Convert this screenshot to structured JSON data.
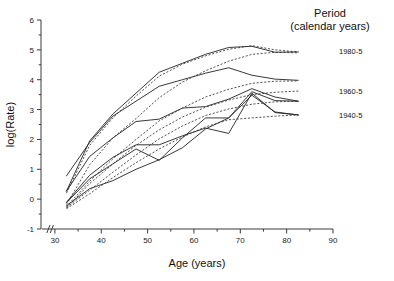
{
  "chart_data": {
    "type": "line",
    "title": "",
    "xlabel": "Age (years)",
    "ylabel": "log(Rate)",
    "xlim": [
      27,
      90
    ],
    "ylim": [
      -1,
      6
    ],
    "xticks": [
      30,
      40,
      50,
      60,
      70,
      80,
      90
    ],
    "xtick_labels": [
      "30",
      "40",
      "50",
      "60",
      "70",
      "80",
      "90"
    ],
    "xminor_step": 5,
    "yticks": [
      -1,
      0,
      1,
      2,
      3,
      4,
      5,
      6
    ],
    "ytick_labels": [
      "-1",
      "0",
      "1",
      "2",
      "3",
      "4",
      "5",
      "6"
    ],
    "grid": false,
    "axis_break": "//",
    "axis_break_note": "x axis broken between 0 and 27",
    "legend": {
      "position": "right-outside",
      "title_line1": "Period",
      "title_line2": "(calendar years)",
      "entries": [
        {
          "label": "1980-5",
          "y_at_label": 4.95
        },
        {
          "label": "1960-5",
          "y_at_label": 3.62
        },
        {
          "label": "1940-5",
          "y_at_label": 2.82
        }
      ]
    },
    "linestyles": {
      "solid": "age-period cohort solid curves",
      "dashed": "age-period cohort dashed curves"
    },
    "x": [
      32.5,
      37.5,
      42.5,
      47.5,
      52.5,
      57.5,
      62.5,
      67.5,
      72.5,
      77.5,
      82.5
    ],
    "series": [
      {
        "name": "solid-1",
        "style": "solid",
        "x": [
          32.5,
          37.5,
          42.5,
          47.5,
          52.5,
          57.5,
          62.5,
          67.5,
          72.5,
          77.5,
          82.5
        ],
        "values": [
          0.27,
          1.95,
          2.85,
          3.55,
          4.25,
          4.55,
          4.85,
          5.08,
          5.12,
          4.92,
          4.93
        ]
      },
      {
        "name": "solid-2",
        "style": "solid",
        "x": [
          32.5,
          37.5,
          42.5,
          47.5,
          52.5,
          57.5,
          62.5,
          67.5,
          72.5,
          77.5,
          82.5
        ],
        "values": [
          0.78,
          1.9,
          2.78,
          3.28,
          3.78,
          4.0,
          4.22,
          4.4,
          4.15,
          4.02,
          3.98
        ]
      },
      {
        "name": "solid-3",
        "style": "solid",
        "x": [
          32.5,
          37.5,
          42.5,
          47.5,
          52.5,
          57.5,
          62.5,
          67.5,
          72.5,
          77.5,
          82.5
        ],
        "values": [
          0.27,
          1.43,
          2.05,
          2.6,
          2.68,
          3.05,
          3.1,
          3.35,
          3.7,
          3.42,
          3.28
        ]
      },
      {
        "name": "solid-4",
        "style": "solid",
        "x": [
          32.5,
          37.5,
          42.5,
          47.5,
          52.5,
          57.5,
          62.5,
          67.5,
          72.5,
          77.5,
          82.5
        ],
        "values": [
          -0.1,
          0.8,
          1.4,
          1.82,
          1.82,
          2.12,
          2.38,
          2.2,
          3.55,
          2.9,
          2.82
        ]
      },
      {
        "name": "solid-5",
        "style": "solid",
        "x": [
          32.5,
          37.5,
          42.5,
          47.5,
          52.5,
          57.5,
          62.5,
          67.5,
          72.5,
          77.5,
          82.5
        ],
        "values": [
          -0.12,
          0.68,
          1.18,
          1.68,
          1.3,
          2.05,
          2.72,
          2.72,
          3.6,
          3.3,
          3.28
        ]
      },
      {
        "name": "solid-6",
        "style": "solid",
        "x": [
          32.5,
          37.5,
          42.5,
          47.5,
          52.5,
          57.5,
          62.5,
          67.5,
          72.5,
          77.5,
          82.5
        ],
        "values": [
          -0.22,
          0.35,
          0.62,
          1.0,
          1.32,
          1.72,
          2.35,
          2.72,
          3.48,
          2.92,
          2.82
        ]
      },
      {
        "name": "dashed-1",
        "style": "dashed",
        "x": [
          32.5,
          37.5,
          42.5,
          47.5,
          52.5,
          57.5,
          62.5,
          67.5,
          72.5,
          77.5,
          82.5
        ],
        "values": [
          0.2,
          1.8,
          2.72,
          3.45,
          4.12,
          4.52,
          4.8,
          5.02,
          5.14,
          5.0,
          4.93
        ]
      },
      {
        "name": "dashed-2",
        "style": "dashed",
        "x": [
          32.5,
          37.5,
          42.5,
          47.5,
          52.5,
          57.5,
          62.5,
          67.5,
          72.5,
          77.5,
          82.5
        ],
        "values": [
          -0.18,
          1.15,
          2.05,
          2.7,
          3.4,
          3.92,
          4.3,
          4.62,
          4.85,
          4.92,
          4.9
        ]
      },
      {
        "name": "dashed-3",
        "style": "dashed",
        "x": [
          32.5,
          37.5,
          42.5,
          47.5,
          52.5,
          57.5,
          62.5,
          67.5,
          72.5,
          77.5,
          82.5
        ],
        "values": [
          -0.25,
          0.6,
          1.35,
          2.0,
          2.62,
          3.05,
          3.42,
          3.68,
          3.88,
          3.95,
          3.96
        ]
      },
      {
        "name": "dashed-4",
        "style": "dashed",
        "x": [
          32.5,
          37.5,
          42.5,
          47.5,
          52.5,
          57.5,
          62.5,
          67.5,
          72.5,
          77.5,
          82.5
        ],
        "values": [
          -0.3,
          0.52,
          1.18,
          1.8,
          2.32,
          2.75,
          3.08,
          3.32,
          3.5,
          3.58,
          3.62
        ]
      },
      {
        "name": "dashed-5",
        "style": "dashed",
        "x": [
          32.5,
          37.5,
          42.5,
          47.5,
          52.5,
          57.5,
          62.5,
          67.5,
          72.5,
          77.5,
          82.5
        ],
        "values": [
          -0.28,
          0.3,
          0.9,
          1.48,
          2.02,
          2.45,
          2.8,
          3.02,
          3.18,
          3.26,
          3.28
        ]
      },
      {
        "name": "dashed-6",
        "style": "dashed",
        "x": [
          32.5,
          37.5,
          42.5,
          47.5,
          52.5,
          57.5,
          62.5,
          67.5,
          72.5,
          77.5,
          82.5
        ],
        "values": [
          -0.32,
          0.18,
          0.72,
          1.22,
          1.68,
          2.08,
          2.42,
          2.66,
          2.72,
          2.78,
          2.82
        ]
      }
    ]
  }
}
